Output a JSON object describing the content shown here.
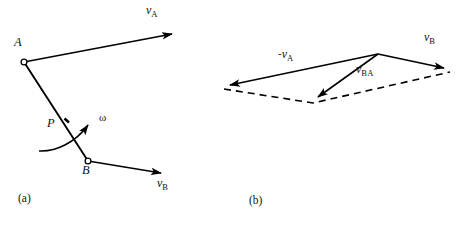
{
  "figure": {
    "background_color": "#ffffff",
    "stroke_color": "#000000",
    "panels": [
      {
        "id": "a",
        "caption": "(a)",
        "caption_pos": {
          "x": 18,
          "y": 194
        },
        "description": "Rigid bar AB with velocity vectors at A and B and angular velocity omega"
      },
      {
        "id": "b",
        "caption": "(b)",
        "caption_pos": {
          "x": 249,
          "y": 196
        },
        "description": "Vector polygon showing v_B = v_A + v_BA"
      }
    ]
  },
  "panel_a": {
    "caption": "(a)",
    "points": [
      {
        "name": "A",
        "label": "A",
        "x": 24,
        "y": 62,
        "label_x": 16,
        "label_y": 43
      },
      {
        "name": "B",
        "label": "B",
        "x": 88,
        "y": 161,
        "label_x": 83,
        "label_y": 168
      },
      {
        "name": "P",
        "label": "P",
        "x": 63,
        "y": 124,
        "label_x": 48,
        "label_y": 120
      }
    ],
    "bar": {
      "from": "A",
      "to": "B",
      "label": "rigid-bar-AB"
    },
    "vectors": [
      {
        "name": "v_A",
        "label_v": "v",
        "label_sub": "A",
        "label_sign": "",
        "from": {
          "x": 24,
          "y": 62
        },
        "to": {
          "x": 178,
          "y": 33
        },
        "label_x": 145,
        "label_y": 6,
        "style": "solid"
      },
      {
        "name": "v_B",
        "label_v": "v",
        "label_sub": "B",
        "label_sign": "",
        "from": {
          "x": 88,
          "y": 161
        },
        "to": {
          "x": 167,
          "y": 174
        },
        "label_x": 156,
        "label_y": 179,
        "style": "solid"
      }
    ],
    "omega": {
      "symbol": "ω",
      "label_x": 101,
      "label_y": 111,
      "arc_start": {
        "x": 39,
        "y": 151
      },
      "arc_end": {
        "x": 92,
        "y": 122
      },
      "direction": "counterclockwise"
    },
    "tick_mark": {
      "x": 67,
      "y": 121,
      "note": "small tick on bar at P"
    }
  },
  "panel_b": {
    "caption": "(b)",
    "apex": {
      "x": 378,
      "y": 54
    },
    "vectors": [
      {
        "name": "minus_v_A",
        "label_sign": "-",
        "label_v": "v",
        "label_sub": "A",
        "from": {
          "x": 378,
          "y": 54
        },
        "to": {
          "x": 224,
          "y": 86
        },
        "label_x": 281,
        "label_y": 50,
        "style": "solid"
      },
      {
        "name": "v_BA",
        "label_sign": "",
        "label_v": "v",
        "label_sub": "BA",
        "from": {
          "x": 378,
          "y": 54
        },
        "to": {
          "x": 313,
          "y": 101
        },
        "label_x": 357,
        "label_y": 64,
        "style": "solid"
      },
      {
        "name": "v_B",
        "label_sign": "",
        "label_v": "v",
        "label_sub": "B",
        "from": {
          "x": 378,
          "y": 54
        },
        "to": {
          "x": 450,
          "y": 69
        },
        "label_x": 424,
        "label_y": 32,
        "style": "solid"
      }
    ],
    "dashed_path": [
      {
        "x": 224,
        "y": 89
      },
      {
        "x": 313,
        "y": 103
      },
      {
        "x": 450,
        "y": 72
      }
    ],
    "dashed_style": {
      "dash": "7,5",
      "width": 1.6
    }
  }
}
